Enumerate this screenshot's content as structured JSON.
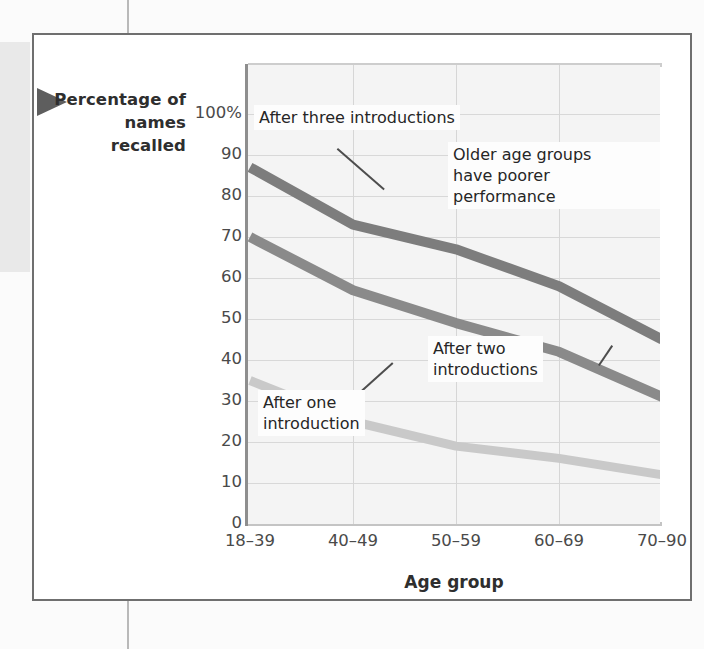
{
  "figure": {
    "y_axis_title": "Percentage\nof names\nrecalled",
    "x_axis_title": "Age group"
  },
  "chart_data": {
    "type": "line",
    "title": "",
    "xlabel": "Age group",
    "ylabel": "Percentage of names recalled",
    "categories": [
      "18–39",
      "40–49",
      "50–59",
      "60–69",
      "70–90"
    ],
    "x_tick_labels": [
      "18–39",
      "40–49",
      "50–59",
      "60–69",
      "70–90"
    ],
    "y_tick_labels": [
      "100%",
      "90",
      "80",
      "70",
      "60",
      "50",
      "40",
      "30",
      "20",
      "10",
      "0"
    ],
    "y_tick_values": [
      100,
      90,
      80,
      70,
      60,
      50,
      40,
      30,
      20,
      10,
      0
    ],
    "ylim": [
      0,
      100
    ],
    "grid": "both",
    "legend_position": "inline-annotations",
    "series": [
      {
        "name": "After three introductions",
        "color": "#7d7d7d",
        "values": [
          87,
          73,
          67,
          58,
          45
        ]
      },
      {
        "name": "After two introductions",
        "color": "#8a8a8a",
        "values": [
          70,
          57,
          49,
          42,
          31
        ]
      },
      {
        "name": "After one introduction",
        "color": "#c9c9c9",
        "values": [
          35,
          25,
          19,
          16,
          12
        ]
      }
    ],
    "annotations": [
      {
        "id": "after-three",
        "text": "After three introductions"
      },
      {
        "id": "older-groups",
        "text": "Older age groups\nhave poorer performance"
      },
      {
        "id": "after-two",
        "text": "After two\nintroductions"
      },
      {
        "id": "after-one",
        "text": "After one\nintroduction"
      }
    ]
  }
}
